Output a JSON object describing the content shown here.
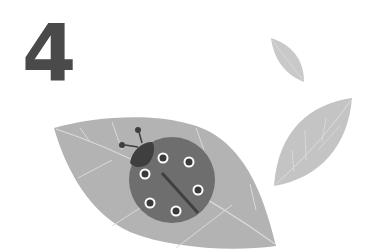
{
  "illustration": {
    "number_label": "4",
    "subject": "ladybug on a leaf",
    "colors": {
      "background": "#ffffff",
      "number": "#4a4a4a",
      "big_leaf": "#b3b3b3",
      "leaf_veins": "#dadada",
      "small_leaf": "#c9c9c9",
      "ladybug_body": "#6e6e6e",
      "ladybug_head": "#3f3f3f",
      "ladybug_spot": "#3a3a3a",
      "spot_ring": "#ffffff"
    },
    "ladybug_spot_count": 6
  }
}
